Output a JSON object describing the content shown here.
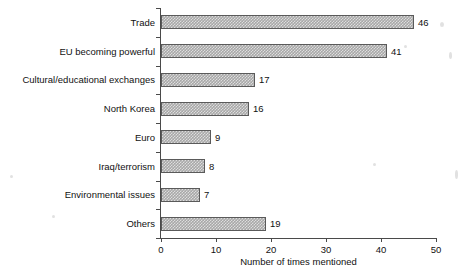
{
  "chart_data": {
    "type": "bar",
    "orientation": "horizontal",
    "title": "",
    "xlabel": "Number of times mentioned",
    "ylabel": "",
    "xlim": [
      0,
      50
    ],
    "xticks": [
      0,
      10,
      20,
      30,
      40,
      50
    ],
    "grid": false,
    "legend": false,
    "categories": [
      "Trade",
      "EU becoming powerful",
      "Cultural/educational exchanges",
      "North Korea",
      "Euro",
      "Iraq/terrorism",
      "Environmental issues",
      "Others"
    ],
    "values": [
      46,
      41,
      17,
      16,
      9,
      8,
      7,
      19
    ],
    "value_labels": [
      "46",
      "41",
      "17",
      "16",
      "9",
      "8",
      "7",
      "19"
    ],
    "bar_fill_color": "#a8a8a8",
    "bar_border_color": "#5a5a5a",
    "axis_color": "#4a4a4a",
    "background_color": "#ffffff"
  }
}
